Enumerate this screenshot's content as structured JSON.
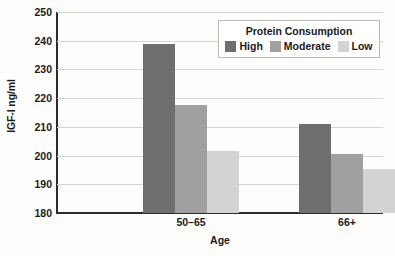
{
  "chart_data": {
    "type": "bar",
    "title": "",
    "xlabel": "Age",
    "ylabel": "IGF-I ng/ml",
    "categories": [
      "50–65",
      "66+"
    ],
    "series": [
      {
        "name": "High",
        "values": [
          239,
          211
        ],
        "color": "#6e6e6e"
      },
      {
        "name": "Moderate",
        "values": [
          217.5,
          200.5
        ],
        "color": "#a0a0a0"
      },
      {
        "name": "Low",
        "values": [
          201.5,
          195.5
        ],
        "color": "#d3d3d3"
      }
    ],
    "ylim": [
      180,
      250
    ],
    "ytick_values": [
      180,
      190,
      200,
      210,
      220,
      230,
      240,
      250
    ],
    "ytick_labels": [
      "180",
      "190",
      "200",
      "210",
      "220",
      "230",
      "240",
      "250"
    ],
    "grid": true,
    "legend_position": "top-right",
    "legend_title": "Protein Consumption"
  },
  "legend": {
    "title": "Protein Consumption",
    "entries": [
      {
        "label": "High",
        "color": "#6e6e6e"
      },
      {
        "label": "Moderate",
        "color": "#a0a0a0"
      },
      {
        "label": "Low",
        "color": "#d3d3d3"
      }
    ]
  },
  "axes": {
    "y_title": "IGF-I ng/ml",
    "x_title": "Age",
    "y_ticks": [
      "250",
      "240",
      "230",
      "220",
      "210",
      "200",
      "190",
      "180"
    ],
    "x_ticks": [
      "50–65",
      "66+"
    ]
  }
}
